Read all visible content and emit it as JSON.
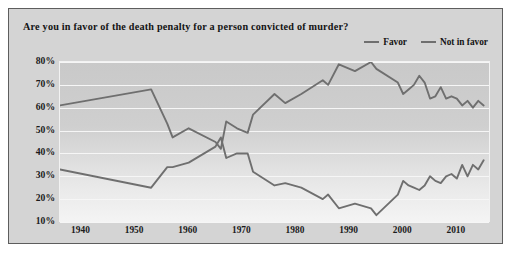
{
  "title": "Are you in favor of the death penalty for a person convicted of murder?",
  "legend": {
    "position": "top-right",
    "items": [
      {
        "label": "Favor",
        "color": "#6f6f6f"
      },
      {
        "label": "Not in favor",
        "color": "#6f6f6f"
      }
    ]
  },
  "axis": {
    "y_ticks": [
      "10%",
      "20%",
      "30%",
      "40%",
      "50%",
      "60%",
      "70%",
      "80%"
    ],
    "x_ticks": [
      "1940",
      "1950",
      "1960",
      "1970",
      "1980",
      "1990",
      "2000",
      "2010"
    ]
  },
  "chart_data": {
    "type": "line",
    "title": "Are you in favor of the death penalty for a person convicted of murder?",
    "xlabel": "",
    "ylabel": "",
    "xlim": [
      1936,
      2016
    ],
    "ylim": [
      10,
      80
    ],
    "grid": true,
    "legend_position": "top-right",
    "x": [
      1936,
      1953,
      1956,
      1957,
      1960,
      1965,
      1966,
      1967,
      1969,
      1971,
      1972,
      1976,
      1978,
      1981,
      1985,
      1986,
      1988,
      1991,
      1994,
      1995,
      1999,
      2000,
      2001,
      2002,
      2003,
      2004,
      2005,
      2006,
      2007,
      2008,
      2009,
      2010,
      2011,
      2012,
      2013,
      2014,
      2015
    ],
    "series": [
      {
        "name": "Favor",
        "color": "#6f6f6f",
        "values": [
          61,
          68,
          53,
          47,
          51,
          45,
          42,
          54,
          51,
          49,
          57,
          66,
          62,
          66,
          72,
          70,
          79,
          76,
          80,
          77,
          71,
          66,
          68,
          70,
          74,
          71,
          64,
          65,
          69,
          64,
          65,
          64,
          61,
          63,
          60,
          63,
          61
        ]
      },
      {
        "name": "Not in favor",
        "color": "#6f6f6f",
        "values": [
          33,
          25,
          34,
          34,
          36,
          43,
          47,
          38,
          40,
          40,
          32,
          26,
          27,
          25,
          20,
          22,
          16,
          18,
          16,
          13,
          22,
          28,
          26,
          25,
          24,
          26,
          30,
          28,
          27,
          30,
          31,
          29,
          35,
          30,
          35,
          33,
          37
        ]
      }
    ],
    "annotations": [
      {
        "text": "Lines cross around 1966 when opposition briefly exceeded support",
        "x": 1966
      }
    ]
  }
}
